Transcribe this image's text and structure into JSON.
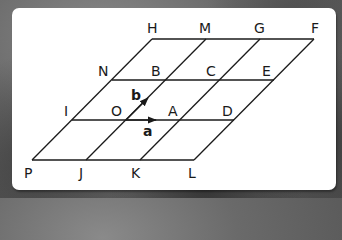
{
  "diagram": {
    "type": "parallelogram-grid",
    "colors": {
      "line": "#1a1a1a",
      "card": "#ffffff",
      "background": "#6a6a6a"
    },
    "points": [
      {
        "name": "H",
        "label": "H"
      },
      {
        "name": "M",
        "label": "M"
      },
      {
        "name": "G",
        "label": "G"
      },
      {
        "name": "F",
        "label": "F"
      },
      {
        "name": "N",
        "label": "N"
      },
      {
        "name": "B",
        "label": "B"
      },
      {
        "name": "C",
        "label": "C"
      },
      {
        "name": "E",
        "label": "E"
      },
      {
        "name": "I",
        "label": "I"
      },
      {
        "name": "O",
        "label": "O"
      },
      {
        "name": "A",
        "label": "A"
      },
      {
        "name": "D",
        "label": "D"
      },
      {
        "name": "P",
        "label": "P"
      },
      {
        "name": "J",
        "label": "J"
      },
      {
        "name": "K",
        "label": "K"
      },
      {
        "name": "L",
        "label": "L"
      }
    ],
    "vectors": [
      {
        "name": "a",
        "label": "a",
        "from": "O",
        "to": "A"
      },
      {
        "name": "b",
        "label": "b",
        "from": "O",
        "to": "B"
      }
    ]
  }
}
